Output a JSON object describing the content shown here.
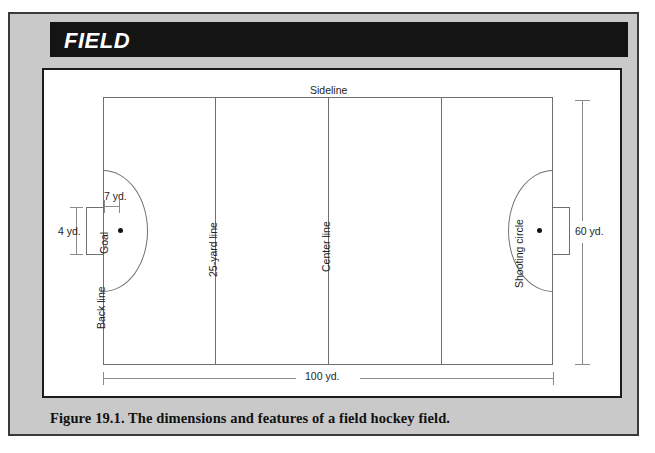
{
  "header": {
    "title": "FIELD"
  },
  "caption": {
    "text": "Figure 19.1.  The dimensions and features of a field hockey field."
  },
  "diagram": {
    "labels": {
      "sideline": "Sideline",
      "back_line": "Back line",
      "twentyfive_yard_line": "25-yard line",
      "center_line": "Center line",
      "shooting_circle": "Shooting circle",
      "goal": "Goal"
    },
    "dimensions": {
      "length": "100 yd.",
      "width": "60 yd.",
      "goal_width": "4 yd.",
      "penalty_spot_distance": "7 yd."
    },
    "colors": {
      "header_bar": "#141414",
      "panel": "#c9c9c9",
      "figure_background": "#ffffff",
      "line": "#6f6f6f",
      "dimension_line": "#8a8a8a",
      "spot": "#141414"
    },
    "features": [
      "Back line",
      "Sideline",
      "25-yard line",
      "Center line",
      "Shooting circle",
      "Goal",
      "Penalty spot"
    ]
  }
}
